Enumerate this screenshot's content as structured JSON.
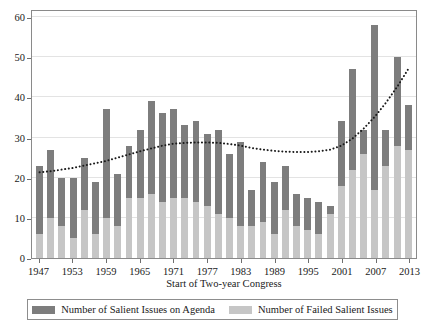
{
  "chart_data": {
    "type": "bar",
    "title": "",
    "subtitle": "",
    "xlabel": "Start of Two-year Congress",
    "ylabel": "",
    "ylim": [
      0,
      62
    ],
    "yticks": [
      0,
      10,
      20,
      30,
      40,
      50,
      60
    ],
    "grid": true,
    "stacked": true,
    "legend_position": "bottom",
    "categories": [
      "1947",
      "1949",
      "1951",
      "1953",
      "1955",
      "1957",
      "1959",
      "1961",
      "1963",
      "1965",
      "1967",
      "1969",
      "1971",
      "1973",
      "1975",
      "1977",
      "1979",
      "1981",
      "1983",
      "1985",
      "1987",
      "1989",
      "1991",
      "1993",
      "1995",
      "1997",
      "1999",
      "2001",
      "2003",
      "2005",
      "2007",
      "2009",
      "2011",
      "2013"
    ],
    "xtick_labels": [
      "1947",
      "1953",
      "1959",
      "1965",
      "1971",
      "1977",
      "1983",
      "1989",
      "1995",
      "2001",
      "2007",
      "2013"
    ],
    "xtick_indices": [
      0,
      3,
      6,
      9,
      12,
      15,
      18,
      21,
      24,
      27,
      30,
      33
    ],
    "series": [
      {
        "name": "Number of Salient Issues on Agenda",
        "color": "#7d7d7d",
        "values": [
          23,
          27,
          20,
          20,
          25,
          19,
          37,
          21,
          28,
          32,
          39,
          36,
          37,
          33,
          34,
          31,
          32,
          26,
          29,
          17,
          24,
          19,
          23,
          16,
          15,
          14,
          13,
          34,
          47,
          32,
          58,
          32,
          50,
          38
        ]
      },
      {
        "name": "Number of Failed Salient Issues",
        "color": "#c6c6c6",
        "values": [
          6,
          10,
          8,
          5,
          12,
          6,
          10,
          8,
          15,
          15,
          16,
          14,
          15,
          15,
          14,
          13,
          11,
          10,
          8,
          8,
          9,
          6,
          12,
          8,
          7,
          6,
          11,
          18,
          22,
          26,
          17,
          23,
          28,
          27
        ]
      }
    ],
    "trend_line": {
      "name": "trend",
      "style": "dotted",
      "color": "#1a1a1a",
      "values": [
        21.5,
        21.8,
        22.2,
        22.6,
        23.2,
        23.8,
        24.4,
        25.2,
        26.0,
        26.8,
        27.5,
        28.2,
        28.7,
        28.9,
        29.0,
        29.0,
        28.9,
        28.6,
        28.2,
        27.6,
        27.2,
        26.9,
        26.7,
        26.6,
        26.6,
        26.8,
        27.2,
        28.2,
        30.0,
        32.5,
        35.5,
        39.0,
        43.0,
        47.5
      ]
    }
  },
  "axis": {
    "y_labels": [
      "0",
      "10",
      "20",
      "30",
      "40",
      "50",
      "60"
    ],
    "x_title": "Start of Two-year Congress"
  },
  "legend": {
    "items": [
      {
        "label": "Number of Salient Issues on Agenda",
        "swatch": "dark-swatch-icon"
      },
      {
        "label": "Number of Failed Salient Issues",
        "swatch": "light-swatch-icon"
      }
    ]
  }
}
